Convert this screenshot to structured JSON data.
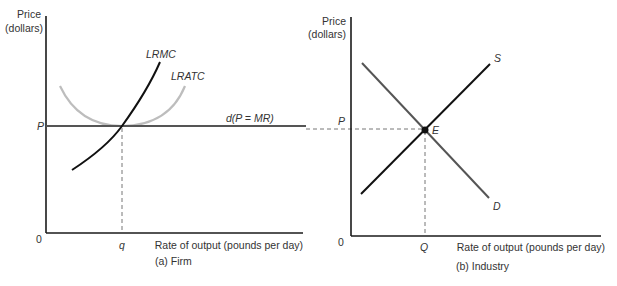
{
  "panel_a": {
    "y_axis_label_1": "Price",
    "y_axis_label_2": "(dollars)",
    "origin": "0",
    "price_label": "P",
    "quantity_label": "q",
    "x_axis_label": "Rate of output (pounds per day)",
    "caption": "(a) Firm",
    "curves": {
      "lrmc": "LRMC",
      "lratc": "LRATC",
      "demand": "d(P = MR)"
    }
  },
  "panel_b": {
    "y_axis_label_1": "Price",
    "y_axis_label_2": "(dollars)",
    "origin": "0",
    "price_label": "P",
    "quantity_label": "Q",
    "x_axis_label": "Rate of output (pounds per day)",
    "caption": "(b) Industry",
    "curves": {
      "supply": "S",
      "demand": "D",
      "equilibrium": "E"
    }
  },
  "colors": {
    "axis": "#1a1a1a",
    "lrmc": "#111111",
    "lratc": "#bdbdbd",
    "demand_line": "#555555",
    "supply": "#111111",
    "industry_demand": "#555555",
    "dashed": "#777777"
  }
}
